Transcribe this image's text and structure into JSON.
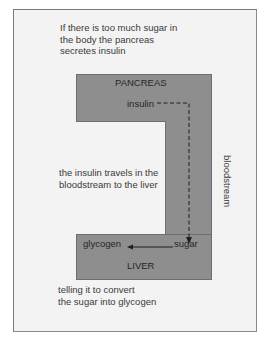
{
  "captions": {
    "intro": "If there is too much sugar in\nthe body the pancreas\nsecretes insulin",
    "travel": "the insulin travels in the\nbloodstream to the liver",
    "convert": "telling it to convert\nthe sugar into glycogen"
  },
  "organs": {
    "pancreas": "PANCREAS",
    "liver": "LIVER"
  },
  "substances": {
    "insulin": "insulin",
    "sugar": "sugar",
    "glycogen": "glycogen"
  },
  "pathway": {
    "label": "bloodstream"
  },
  "colors": {
    "frame_fill": "#f3f3f3",
    "organ_fill": "#8e8e8e",
    "organ_border": "#6e6e6e",
    "text": "#262626"
  }
}
